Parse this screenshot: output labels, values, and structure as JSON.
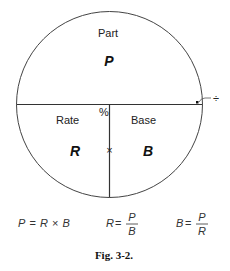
{
  "diagram": {
    "top_label": "Part",
    "top_symbol": "P",
    "left_label": "Rate",
    "left_symbol": "R",
    "right_label": "Base",
    "right_symbol": "B",
    "percent_sign": "%",
    "multiply_sign": "×",
    "divide_sign": "÷"
  },
  "formulas": [
    {
      "lhs": "P",
      "eq": "=",
      "rhs_a": "R",
      "op": "×",
      "rhs_b": "B"
    },
    {
      "lhs": "R",
      "eq": "=",
      "num": "P",
      "den": "B"
    },
    {
      "lhs": "B",
      "eq": "=",
      "num": "P",
      "den": "R"
    }
  ],
  "caption": "Fig. 3-2."
}
